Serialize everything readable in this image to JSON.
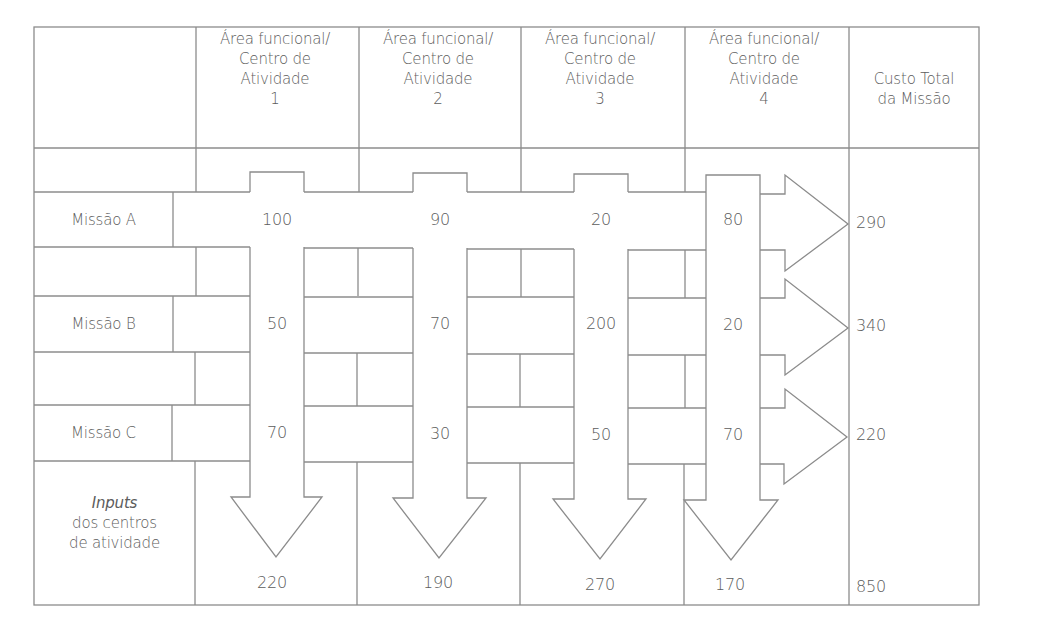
{
  "header": {
    "columns": [
      {
        "line1": "Área funcional/",
        "line2": "Centro de",
        "line3": "Atividade",
        "line4": "1"
      },
      {
        "line1": "Área funcional/",
        "line2": "Centro de",
        "line3": "Atividade",
        "line4": "2"
      },
      {
        "line1": "Área funcional/",
        "line2": "Centro de",
        "line3": "Atividade",
        "line4": "3"
      },
      {
        "line1": "Área funcional/",
        "line2": "Centro de",
        "line3": "Atividade",
        "line4": "4"
      }
    ],
    "total": {
      "line1": "Custo Total",
      "line2": "da Missão"
    }
  },
  "rows": [
    {
      "label": "Missão A",
      "values": [
        "100",
        "90",
        "20",
        "80"
      ],
      "total": "290"
    },
    {
      "label": "Missão B",
      "values": [
        "50",
        "70",
        "200",
        "20"
      ],
      "total": "340"
    },
    {
      "label": "Missão C",
      "values": [
        "70",
        "30",
        "50",
        "70"
      ],
      "total": "220"
    }
  ],
  "footer": {
    "label_italic": "Inputs",
    "label_line2": "dos centros",
    "label_line3": "de atividade",
    "totals": [
      "220",
      "190",
      "270",
      "170"
    ],
    "grand_total": "850"
  },
  "colors": {
    "line": "#8a8a8a",
    "text": "#5c5c5c",
    "background": "#ffffff"
  }
}
